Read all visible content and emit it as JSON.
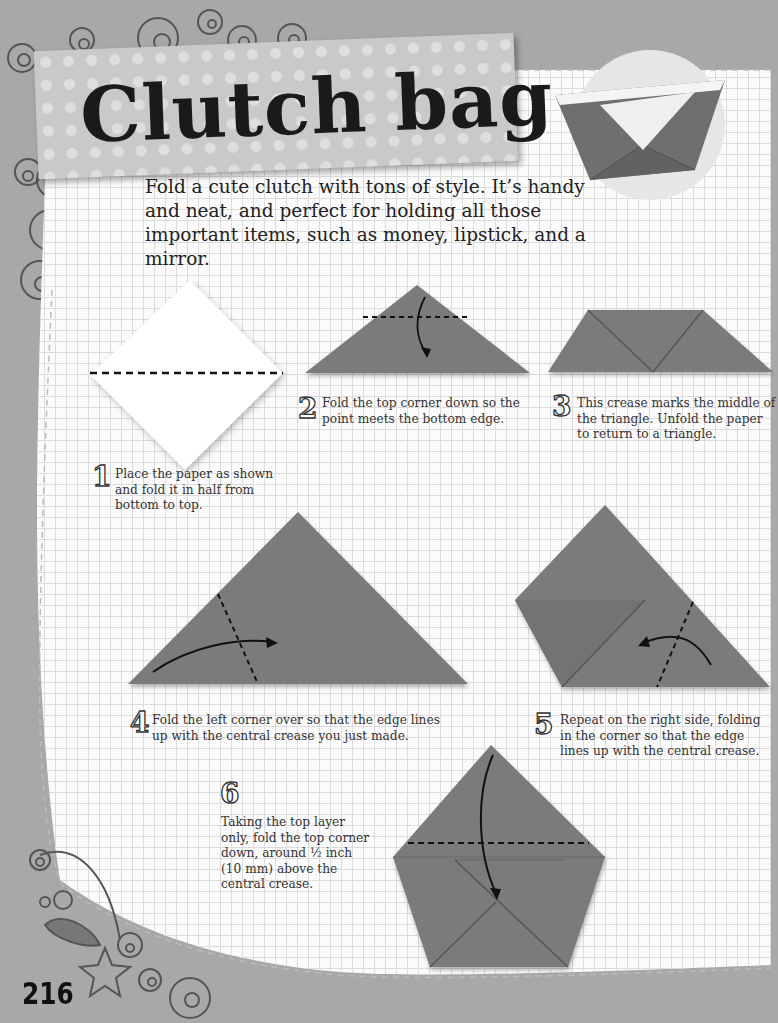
{
  "page": {
    "title": "Clutch bag",
    "intro": "Fold a cute clutch with tons of style. It’s handy and neat, and perfect for holding all those important items, such as money, lipstick, and a mirror.",
    "page_number": "216"
  },
  "steps": [
    {
      "number": "1",
      "text": "Place the paper as shown and fold it in half from bottom to top."
    },
    {
      "number": "2",
      "text": "Fold the top corner down so the point meets the bottom edge."
    },
    {
      "number": "3",
      "text": "This crease marks the middle of the triangle. Unfold the paper to return to a triangle."
    },
    {
      "number": "4",
      "text": "Fold the left corner over so that the edge lines up with the central crease you just made."
    },
    {
      "number": "5",
      "text": "Repeat on the right side, folding in the corner so that the edge lines up with the central crease."
    },
    {
      "number": "6",
      "text": "Taking the top layer only, fold the top corner down, around ½ inch (10 mm) above the central crease."
    }
  ],
  "colors": {
    "paper": "#7b7b7b",
    "paper_dark": "#5e5e5e",
    "background_gray": "#a8a8a8",
    "grid_line": "#dcdcdc",
    "banner": "#c9c9c9"
  }
}
